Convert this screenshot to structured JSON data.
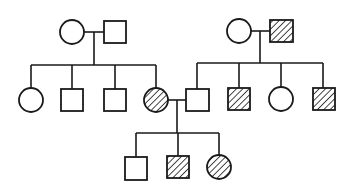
{
  "diagram": {
    "type": "pedigree",
    "colors": {
      "line": "#1a1a1a",
      "background": "#ffffff"
    },
    "legend": {
      "circle": "female",
      "square": "male",
      "hatched": "affected",
      "open": "unaffected"
    },
    "generations": [
      {
        "id": "I",
        "individuals": [
          {
            "id": "I-1",
            "sex": "female",
            "affected": false
          },
          {
            "id": "I-2",
            "sex": "male",
            "affected": false
          },
          {
            "id": "I-3",
            "sex": "female",
            "affected": false
          },
          {
            "id": "I-4",
            "sex": "male",
            "affected": true
          }
        ]
      },
      {
        "id": "II",
        "individuals": [
          {
            "id": "II-1",
            "sex": "female",
            "affected": false,
            "parents": [
              "I-1",
              "I-2"
            ]
          },
          {
            "id": "II-2",
            "sex": "male",
            "affected": false,
            "parents": [
              "I-1",
              "I-2"
            ]
          },
          {
            "id": "II-3",
            "sex": "male",
            "affected": false,
            "parents": [
              "I-1",
              "I-2"
            ]
          },
          {
            "id": "II-4",
            "sex": "female",
            "affected": true,
            "parents": [
              "I-1",
              "I-2"
            ]
          },
          {
            "id": "II-5",
            "sex": "male",
            "affected": false,
            "parents": [
              "I-3",
              "I-4"
            ]
          },
          {
            "id": "II-6",
            "sex": "male",
            "affected": true,
            "parents": [
              "I-3",
              "I-4"
            ]
          },
          {
            "id": "II-7",
            "sex": "female",
            "affected": false,
            "parents": [
              "I-3",
              "I-4"
            ]
          },
          {
            "id": "II-8",
            "sex": "male",
            "affected": true,
            "parents": [
              "I-3",
              "I-4"
            ]
          }
        ]
      },
      {
        "id": "III",
        "individuals": [
          {
            "id": "III-1",
            "sex": "male",
            "affected": false,
            "parents": [
              "II-4",
              "II-5"
            ]
          },
          {
            "id": "III-2",
            "sex": "male",
            "affected": true,
            "parents": [
              "II-4",
              "II-5"
            ]
          },
          {
            "id": "III-3",
            "sex": "female",
            "affected": true,
            "parents": [
              "II-4",
              "II-5"
            ]
          }
        ]
      }
    ],
    "matings": [
      [
        "I-1",
        "I-2"
      ],
      [
        "I-3",
        "I-4"
      ],
      [
        "II-4",
        "II-5"
      ]
    ]
  }
}
